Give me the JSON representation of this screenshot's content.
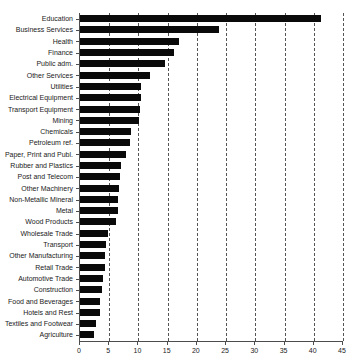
{
  "chart_data": {
    "type": "bar",
    "orientation": "horizontal",
    "title": "",
    "subtitle": "",
    "xlabel": "",
    "ylabel": "",
    "xlim": [
      0,
      45
    ],
    "xticks": [
      0,
      5,
      10,
      15,
      20,
      25,
      30,
      35,
      40,
      45
    ],
    "xtick_labels": [
      "0",
      "5",
      "10",
      "15",
      "20",
      "25",
      "30",
      "35",
      "40",
      "45"
    ],
    "grid": true,
    "grid_axis": "x",
    "grid_style": "dashed",
    "legend": false,
    "bar_color": "#0a0a0a",
    "categories": [
      "Education",
      "Business Services",
      "Health",
      "Finance",
      "Public adm.",
      "Other Services",
      "Utilities",
      "Electrical Equipment",
      "Transport Equipment",
      "Mining",
      "Chemicals",
      "Petroleum ref.",
      "Paper, Print and Publ.",
      "Rubber and Plastics",
      "Post and Telecom",
      "Other Machinery",
      "Non-Metallic Mineral",
      "Metal",
      "Wood Products",
      "Wholesale Trade",
      "Transport",
      "Other Manufacturing",
      "Retail Trade",
      "Automotive Trade",
      "Construction",
      "Food and Beverages",
      "Hotels and Rest",
      "Textiles and Footwear",
      "Agriculture"
    ],
    "values": [
      41.3,
      23.8,
      17.0,
      16.0,
      14.6,
      12.0,
      10.4,
      10.4,
      10.3,
      10.1,
      8.7,
      8.5,
      7.9,
      7.0,
      6.8,
      6.6,
      6.5,
      6.5,
      6.1,
      4.8,
      4.4,
      4.3,
      4.2,
      4.0,
      3.7,
      3.4,
      3.4,
      2.7,
      2.4
    ]
  }
}
